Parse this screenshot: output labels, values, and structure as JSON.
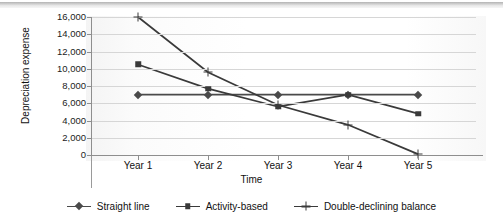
{
  "chart_data": {
    "type": "line",
    "title": "",
    "xlabel": "Time",
    "ylabel": "Depreciation expense",
    "categories": [
      "Year 1",
      "Year 2",
      "Year 3",
      "Year 4",
      "Year 5"
    ],
    "ylim": [
      0,
      16000
    ],
    "ytick_labels": [
      "16,000",
      "14,000",
      "12,000",
      "10,000",
      "8,000",
      "6,000",
      "4,000",
      "2,000",
      "0"
    ],
    "ytick_values": [
      16000,
      14000,
      12000,
      10000,
      8000,
      6000,
      4000,
      2000,
      0
    ],
    "grid": true,
    "legend_position": "bottom",
    "series": [
      {
        "name": "Straight line",
        "marker": "diamond",
        "color": "#4a4a4a",
        "values": [
          7000,
          7000,
          7000,
          7000,
          7000
        ]
      },
      {
        "name": "Activity-based",
        "marker": "square",
        "color": "#3a3a3a",
        "values": [
          10500,
          7700,
          5600,
          7000,
          4800
        ]
      },
      {
        "name": "Double-declining balance",
        "marker": "cross",
        "color": "#3a3a3a",
        "values": [
          16000,
          9600,
          5800,
          3500,
          100
        ]
      }
    ]
  }
}
